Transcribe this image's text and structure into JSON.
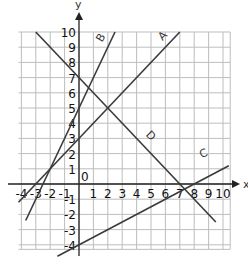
{
  "chart_data": {
    "type": "line",
    "title": "",
    "xlabel": "x",
    "ylabel": "y",
    "xlim": [
      -4,
      10
    ],
    "ylim": [
      -4,
      10
    ],
    "grid": true,
    "x_ticks": [
      "-4",
      "-3",
      "-2",
      "-1",
      "1",
      "2",
      "3",
      "4",
      "5",
      "6",
      "7",
      "8",
      "9",
      "10"
    ],
    "y_ticks": [
      "10",
      "9",
      "8",
      "7",
      "6",
      "5",
      "4",
      "3",
      "2",
      "1",
      "-1",
      "-2",
      "-3",
      "-4"
    ],
    "origin_label": "0",
    "series": [
      {
        "name": "A",
        "equation": "y = x + 3",
        "x": [
          -4.2,
          7
        ],
        "y": [
          -1.2,
          10
        ]
      },
      {
        "name": "B",
        "equation": "y = 2x + 5",
        "x": [
          -3.7,
          2.5
        ],
        "y": [
          -2.4,
          10
        ]
      },
      {
        "name": "C",
        "equation": "y = 0.5x - 4",
        "x": [
          -1.5,
          10.4
        ],
        "y": [
          -4.75,
          1.2
        ]
      },
      {
        "name": "D",
        "equation": "y = -x + 7",
        "x": [
          -3,
          9.5
        ],
        "y": [
          10,
          -2.5
        ]
      }
    ],
    "line_color": "#3a3a3a",
    "grid_color": "#bdbdbd"
  }
}
